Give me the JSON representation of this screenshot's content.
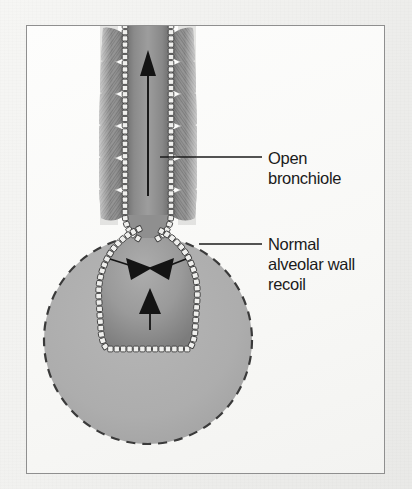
{
  "figure": {
    "type": "anatomical-illustration"
  },
  "labels": [
    {
      "id": "open-bronchiole",
      "text": "Open\nbronchiole",
      "leader_line": true
    },
    {
      "id": "normal-alveolar-wall-recoil",
      "text": "Normal\nalveolar wall\nrecoil",
      "leader_line": true
    }
  ],
  "annotations": {
    "airflow_arrow": "upward airflow through open lumen",
    "recoil_arrows": "three inward-pointing elastic recoil arrows",
    "dashed_circle": "dashed outline of surrounding alveolar space"
  },
  "colors": {
    "page_background": "#f2f2f0",
    "frame_border": "#8f8f8f",
    "frame_fill": "#fbfbfa",
    "label_text": "#1b1b1b",
    "leader_line": "#1b1b1b",
    "lumen_gray": "#8c8c8c",
    "alveolus_gray": "#9a9a9a",
    "dashed_circle_fill": "#adadad",
    "dashed_circle_stroke": "#3a3a3a",
    "epithelium_fill": "#efefed",
    "epithelium_stroke": "#3d3d3d",
    "muscle_gray": "#8a8a8a",
    "arrow_black": "#141414",
    "ghost_text": "#b9b9b7"
  },
  "ghost_text": [
    {
      "text": "ating a",
      "x": 300,
      "y": 36
    },
    {
      "text": "ve latus",
      "x": 296,
      "y": 62
    },
    {
      "text": "wall",
      "x": 318,
      "y": 90
    },
    {
      "text": "the",
      "x": 320,
      "y": 118
    },
    {
      "text": "vev",
      "x": 316,
      "y": 146
    },
    {
      "text": "tubs",
      "x": 320,
      "y": 352
    },
    {
      "text": "w top",
      "x": 310,
      "y": 380
    },
    {
      "text": "educes",
      "x": 302,
      "y": 412
    },
    {
      "text": "tion also",
      "x": 298,
      "y": 440
    }
  ]
}
